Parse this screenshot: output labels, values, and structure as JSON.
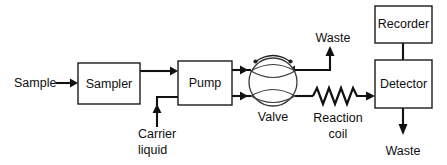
{
  "diagram": {
    "background_color": "#ffffff",
    "line_color": "#111111",
    "text_color": "#0f0f0f",
    "boxes": [
      {
        "id": "sampler",
        "label": "Sampler",
        "x": 78,
        "y": 63,
        "w": 62,
        "h": 41
      },
      {
        "id": "pump",
        "label": "Pump",
        "x": 178,
        "y": 61,
        "w": 54,
        "h": 44
      },
      {
        "id": "recorder",
        "label": "Recorder",
        "x": 375,
        "y": 6,
        "w": 57,
        "h": 37
      },
      {
        "id": "detector",
        "label": "Detector",
        "x": 375,
        "y": 60,
        "w": 57,
        "h": 48
      }
    ],
    "labels": {
      "sample": "Sample",
      "carrier_liquid_line1": "Carrier",
      "carrier_liquid_line2": "liquid",
      "valve": "Valve",
      "reaction_coil_line1": "Reaction",
      "reaction_coil_line2": "coil",
      "waste_top": "Waste",
      "waste_bottom": "Waste"
    },
    "components": {
      "valve": {
        "cx": 273,
        "cy": 82,
        "r": 24
      },
      "reaction_coil": {
        "x_start": 313,
        "x_end": 360,
        "y": 96,
        "peaks": 5
      }
    },
    "flow_paths": [
      {
        "name": "sample-to-sampler",
        "from": "Sample",
        "to": "Sampler",
        "direction": "right"
      },
      {
        "name": "sampler-to-pump",
        "from": "Sampler",
        "to": "Pump",
        "direction": "right"
      },
      {
        "name": "carrier-to-pump",
        "from": "Carrier liquid",
        "to": "Pump",
        "direction": "up-right"
      },
      {
        "name": "pump-upper-to-valve",
        "from": "Pump",
        "to": "Valve",
        "direction": "right"
      },
      {
        "name": "pump-lower-to-valve",
        "from": "Pump",
        "to": "Valve",
        "direction": "right"
      },
      {
        "name": "valve-to-waste-top",
        "from": "Valve",
        "to": "Waste",
        "direction": "right-up"
      },
      {
        "name": "valve-to-reaction-coil",
        "from": "Valve",
        "to": "Reaction coil",
        "direction": "right"
      },
      {
        "name": "coil-to-detector",
        "from": "Reaction coil",
        "to": "Detector",
        "direction": "right"
      },
      {
        "name": "detector-to-recorder",
        "from": "Detector",
        "to": "Recorder",
        "direction": "up"
      },
      {
        "name": "detector-to-waste",
        "from": "Detector",
        "to": "Waste",
        "direction": "down"
      }
    ]
  }
}
